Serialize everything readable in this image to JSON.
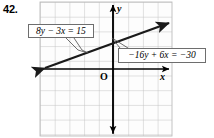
{
  "problem": {
    "number": "42."
  },
  "figure": {
    "type": "coordinate-grid-graph",
    "axis_labels": {
      "x": "x",
      "y": "y",
      "origin": "O"
    },
    "grid": {
      "left": 40,
      "top": 2,
      "right": 172,
      "bottom": 136,
      "cell": 14.7,
      "color": "#b9b9b9",
      "background": "#fdfdfd"
    },
    "axes": {
      "x_axis_y": 69,
      "y_axis_x": 113,
      "color": "#000000"
    },
    "line": {
      "label": "graphed-line",
      "color": "#1a1a1a",
      "start": {
        "x": 42,
        "y": 69
      },
      "end": {
        "x": 172,
        "y": 21
      },
      "arrow_both_ends": true
    },
    "callouts": [
      {
        "name": "equation-label-1",
        "text": "8y − 3x = 15",
        "leader_from": {
          "x": 70,
          "y": 38
        },
        "leader_to": {
          "x": 86,
          "y": 54
        }
      },
      {
        "name": "equation-label-2",
        "text": "−16y + 6x = −30",
        "leader_from": {
          "x": 118,
          "y": 54
        },
        "leader_to": {
          "x": 112,
          "y": 39
        }
      }
    ]
  },
  "colors": {
    "ink": "#000000",
    "grid": "#b9b9b9",
    "box_border": "#6e6e6e",
    "paper": "#ffffff"
  }
}
